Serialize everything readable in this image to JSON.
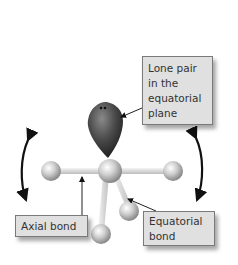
{
  "diagram": {
    "labels": {
      "lone_pair": "Lone pair in the equatorial plane",
      "axial_bond": "Axial bond",
      "equatorial_bond": "Equatorial bond"
    },
    "elements": {
      "central_atom": "central-atom",
      "lone_pair_lobe": "lone-pair",
      "axial_atoms": 2,
      "equatorial_atoms": 2
    },
    "colors": {
      "lone_pair": "#4a4a4a",
      "atom": "#c8c8c8",
      "bond": "#e6e6e6",
      "label_bg": "#e0e0e0",
      "arrow": "#111111"
    }
  }
}
